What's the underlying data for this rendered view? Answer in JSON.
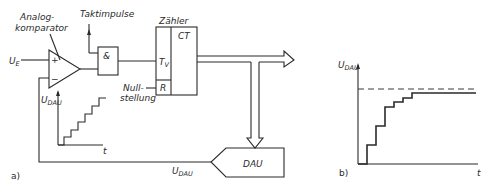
{
  "diagram": {
    "panel_a": {
      "label": "a)",
      "comparator_label_line1": "Analog-",
      "comparator_label_line2": "komparator",
      "clock_label": "Taktimpulse",
      "input_label": "U",
      "input_sub": "E",
      "plus_sign": "+",
      "minus_sign": "−",
      "and_gate_label": "&",
      "counter_title": "Zähler",
      "counter_ct": "CT",
      "counter_tv": "T",
      "counter_tv_sub": "V",
      "counter_r": "R",
      "reset_label_line1": "Null-",
      "reset_label_line2": "stellung",
      "dac_label": "DAU",
      "feedback_label": "U",
      "feedback_sub": "DAU",
      "inset_ylabel": "U",
      "inset_ysub": "DAU",
      "inset_xlabel": "t"
    },
    "panel_b": {
      "label": "b)",
      "ylabel": "U",
      "ysub": "DAU",
      "xlabel": "t"
    },
    "colors": {
      "line": "#2a2a2a",
      "background": "#ffffff"
    }
  }
}
